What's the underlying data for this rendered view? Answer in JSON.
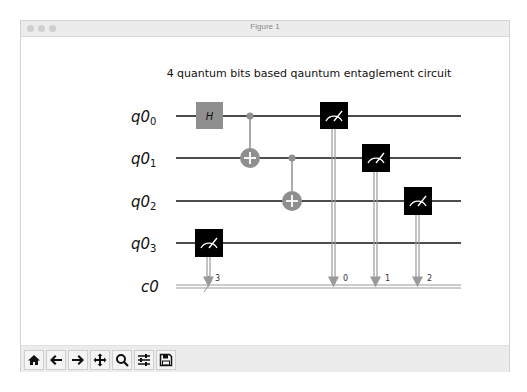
{
  "window": {
    "title": "Figure 1",
    "traffic_lights": [
      "close",
      "minimize",
      "zoom"
    ]
  },
  "figure": {
    "title": "4 quantum bits based qauntum entaglement circuit",
    "qubits": [
      {
        "label": "q0",
        "sub": "0"
      },
      {
        "label": "q0",
        "sub": "1"
      },
      {
        "label": "q0",
        "sub": "2"
      },
      {
        "label": "q0",
        "sub": "3"
      }
    ],
    "classical_register": {
      "label": "c0",
      "width_marker": "4"
    },
    "gates": [
      {
        "type": "H",
        "label": "H",
        "qubit": 0,
        "color": "#8f8f8f"
      },
      {
        "type": "CNOT",
        "control": 0,
        "target": 1,
        "color": "#8f8f8f"
      },
      {
        "type": "CNOT",
        "control": 1,
        "target": 2,
        "color": "#8f8f8f"
      },
      {
        "type": "measure",
        "qubit": 3,
        "cbit": "3"
      },
      {
        "type": "measure",
        "qubit": 0,
        "cbit": "0"
      },
      {
        "type": "measure",
        "qubit": 1,
        "cbit": "1"
      },
      {
        "type": "measure",
        "qubit": 2,
        "cbit": "2"
      }
    ],
    "colors": {
      "wire": "#111111",
      "gate_gray": "#8f8f8f",
      "measure_box": "#000000",
      "classical": "#9a9a9a"
    }
  },
  "toolbar": {
    "buttons": [
      {
        "name": "home",
        "icon": "home-icon"
      },
      {
        "name": "back",
        "icon": "arrow-left-icon"
      },
      {
        "name": "forward",
        "icon": "arrow-right-icon"
      },
      {
        "name": "pan",
        "icon": "move-icon"
      },
      {
        "name": "zoom",
        "icon": "magnifier-icon"
      },
      {
        "name": "configure-subplots",
        "icon": "sliders-icon"
      },
      {
        "name": "save",
        "icon": "floppy-disk-icon"
      }
    ]
  }
}
